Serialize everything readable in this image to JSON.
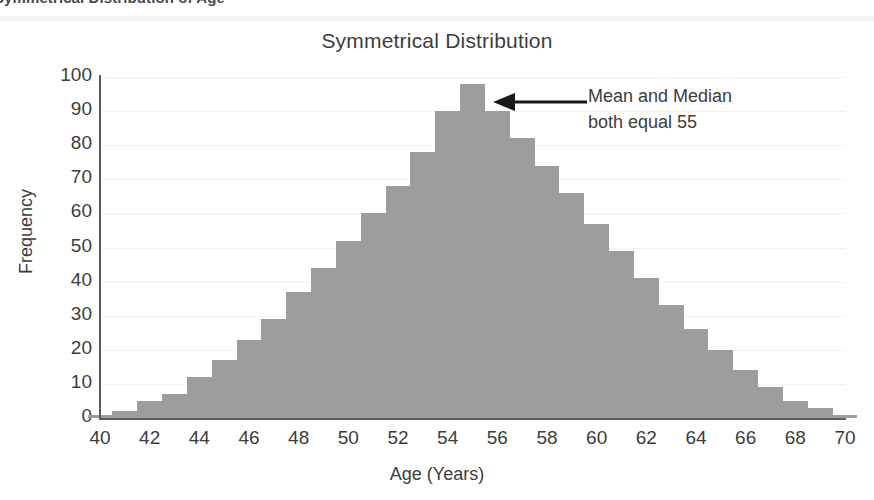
{
  "header": {
    "banner_text": "Symmetrical Distribution of Age"
  },
  "figure": {
    "title": "Symmetrical Distribution",
    "xlabel": "Age (Years)",
    "ylabel": "Frequency",
    "annotation_line1": "Mean and Median",
    "annotation_line2": "both equal 55",
    "bar_color": "#9d9d9d",
    "axis_color": "#5d5d5d",
    "grid_color": "#f2f0f0",
    "text_color": "#3d3d3d"
  },
  "chart_data": {
    "type": "bar",
    "title": "Symmetrical Distribution",
    "xlabel": "Age (Years)",
    "ylabel": "Frequency",
    "xlim": [
      40,
      70
    ],
    "ylim": [
      0,
      100
    ],
    "grid": true,
    "legend": "none",
    "ytick_labels": [
      "100",
      "90",
      "80",
      "70",
      "60",
      "50",
      "40",
      "30",
      "20",
      "10",
      "0"
    ],
    "ytick_values": [
      100,
      90,
      80,
      70,
      60,
      50,
      40,
      30,
      20,
      10,
      0
    ],
    "xtick_labels": [
      "40",
      "42",
      "44",
      "46",
      "48",
      "50",
      "52",
      "54",
      "56",
      "58",
      "60",
      "62",
      "64",
      "66",
      "68",
      "70"
    ],
    "xtick_values": [
      40,
      42,
      44,
      46,
      48,
      50,
      52,
      54,
      56,
      58,
      60,
      62,
      64,
      66,
      68,
      70
    ],
    "bin_width": 1,
    "categories": [
      40,
      41,
      42,
      43,
      44,
      45,
      46,
      47,
      48,
      49,
      50,
      51,
      52,
      53,
      54,
      55,
      56,
      57,
      58,
      59,
      60,
      61,
      62,
      63,
      64,
      65,
      66,
      67,
      68,
      69,
      70
    ],
    "values": [
      1,
      2,
      5,
      7,
      12,
      17,
      23,
      29,
      37,
      44,
      52,
      60,
      68,
      78,
      90,
      98,
      90,
      82,
      74,
      66,
      57,
      49,
      41,
      33,
      26,
      20,
      14,
      9,
      5,
      3,
      1
    ],
    "annotations": [
      {
        "text": "Mean and Median both equal 55",
        "points_to_x": 55,
        "points_to_y": 98,
        "arrow": "left"
      }
    ]
  }
}
